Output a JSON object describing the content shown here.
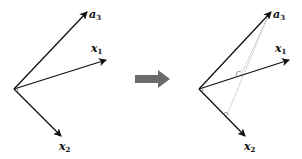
{
  "colors": {
    "vector": "#111111",
    "projection": "#999999",
    "transition_arrow": "#6b6b6b",
    "background": "#ffffff"
  },
  "left_panel": {
    "title": "before",
    "origin": [
      14,
      89
    ],
    "vectors": [
      {
        "id": "a3",
        "label_base": "a",
        "label_sub": "3",
        "tip": [
          87,
          12
        ],
        "label_pos": [
          90,
          17
        ]
      },
      {
        "id": "x1",
        "label_base": "x",
        "label_sub": "1",
        "tip": [
          106,
          60
        ],
        "label_pos": [
          91,
          52
        ]
      },
      {
        "id": "x2",
        "label_base": "x",
        "label_sub": "2",
        "tip": [
          61,
          136
        ],
        "label_pos": [
          60,
          150
        ]
      }
    ],
    "right_angle_marker": "x1-x2"
  },
  "transition": {
    "icon": "right-arrow-icon"
  },
  "right_panel": {
    "title": "after",
    "origin": [
      199,
      89
    ],
    "vectors": [
      {
        "id": "a3",
        "label_base": "a",
        "label_sub": "3",
        "tip": [
          271,
          12
        ],
        "label_pos": [
          273,
          17
        ]
      },
      {
        "id": "x1",
        "label_base": "x",
        "label_sub": "1",
        "tip": [
          289,
          60
        ],
        "label_pos": [
          275,
          52
        ]
      },
      {
        "id": "x2",
        "label_base": "x",
        "label_sub": "2",
        "tip": [
          245,
          136
        ],
        "label_pos": [
          244,
          150
        ]
      }
    ],
    "projections": [
      {
        "from": "a3",
        "onto": "x1",
        "foot": [
          241,
          75
        ]
      },
      {
        "from": "a3",
        "onto": "x2",
        "foot": [
          226,
          117
        ]
      }
    ]
  }
}
